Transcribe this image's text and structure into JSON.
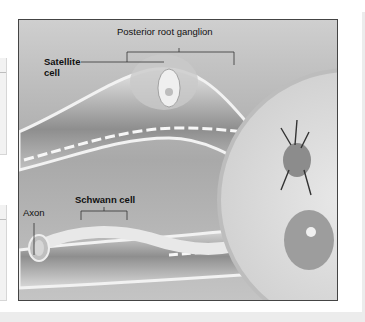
{
  "figure": {
    "labels": {
      "posterior_root_ganglion": "Posterior root ganglion",
      "satellite_cell_line1": "Satellite",
      "satellite_cell_line2": "cell",
      "schwann_cell": "Schwann cell",
      "axon": "Axon"
    }
  },
  "colors": {
    "figure_border": "#444444",
    "background": "#ffffff",
    "panel": "#f2f2f2"
  }
}
